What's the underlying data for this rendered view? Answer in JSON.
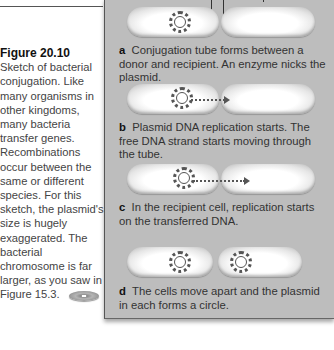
{
  "caption": {
    "figure_label": "Figure 20.10",
    "text": "Sketch of bacterial conjugation. Like many organisms in other kingdoms, many bacteria transfer genes. Recombinations occur between the same or different species. For this sketch, the plasmid's size is hugely exaggerated. The bacterial chromosome is far larger, as you saw in Figure 15.3.",
    "icon": "cd-disc-icon"
  },
  "steps": [
    {
      "letter": "a",
      "text": "Conjugation tube forms between a donor and recipient. An enzyme nicks the plasmid."
    },
    {
      "letter": "b",
      "text": "Plasmid DNA replication starts. The free DNA strand starts moving through the tube."
    },
    {
      "letter": "c",
      "text": "In the recipient cell, replication starts on the transferred DNA."
    },
    {
      "letter": "d",
      "text": "The cells move apart and the plasmid in each forms a circle."
    }
  ],
  "colors": {
    "panel_bg": "#bdbdbd",
    "text": "#333333",
    "page_bg": "#ffffff"
  }
}
